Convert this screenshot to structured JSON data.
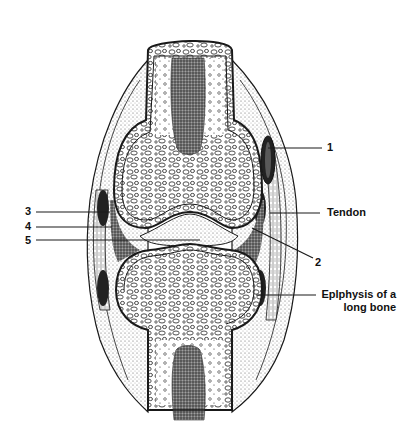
{
  "diagram": {
    "labels": [
      {
        "id": "1",
        "text": "1"
      },
      {
        "id": "tendon",
        "text": "Tendon"
      },
      {
        "id": "2",
        "text": "2"
      },
      {
        "id": "3",
        "text": "3"
      },
      {
        "id": "4",
        "text": "4"
      },
      {
        "id": "5",
        "text": "5"
      },
      {
        "id": "epiphysis",
        "line1": "Eplphysis of a",
        "line2": "long bone"
      }
    ],
    "colors": {
      "ink": "#1a1a1a",
      "marrow": "#555555",
      "background": "#ffffff",
      "cartilage_stipple": "#bbbbbb"
    }
  }
}
